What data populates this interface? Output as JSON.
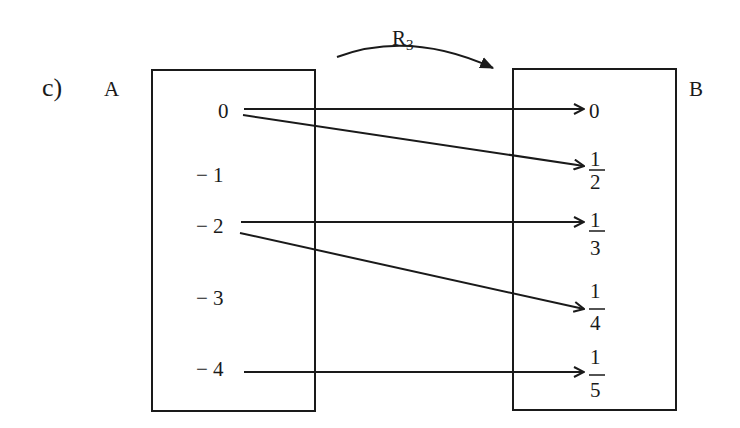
{
  "part_label": "c)",
  "relation": {
    "name": "R",
    "subscript": "3"
  },
  "set_a": {
    "label": "A",
    "elements": [
      "0",
      "− 1",
      "− 2",
      "− 3",
      "− 4"
    ]
  },
  "set_b": {
    "label": "B",
    "elements": [
      {
        "type": "int",
        "value": "0"
      },
      {
        "type": "frac",
        "num": "1",
        "den": "2"
      },
      {
        "type": "frac",
        "num": "1",
        "den": "3"
      },
      {
        "type": "frac",
        "num": "1",
        "den": "4"
      },
      {
        "type": "frac",
        "num": "1",
        "den": "5"
      }
    ]
  },
  "mappings": [
    {
      "from": "0",
      "to": "0"
    },
    {
      "from": "0",
      "to": "1/2"
    },
    {
      "from": "-2",
      "to": "1/3"
    },
    {
      "from": "-2",
      "to": "1/4"
    },
    {
      "from": "-4",
      "to": "1/5"
    }
  ],
  "colors": {
    "ink": "#1a1a1a",
    "background": "#ffffff"
  }
}
